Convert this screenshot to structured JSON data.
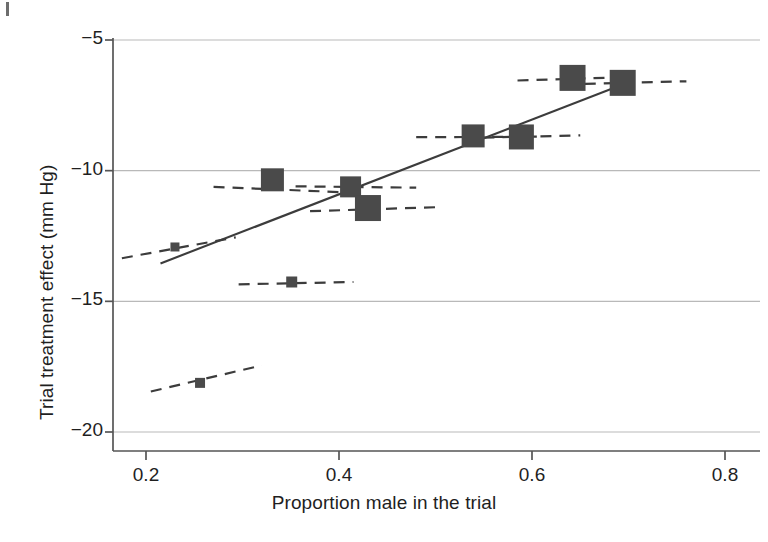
{
  "figure": {
    "background": "#ffffff",
    "marker_color": "#4a4a4a",
    "line_color": "#3c3c3c",
    "grid_color": "#b9b9b9",
    "axis_color": "#555555"
  },
  "chart_data": {
    "type": "scatter",
    "title": "",
    "xlabel": "Proportion male in the trial",
    "ylabel": "Trial treatment effect (mm Hg)",
    "xlim": [
      0.155,
      0.8
    ],
    "ylim": [
      -20.0,
      -4.4
    ],
    "xticks": [
      0.2,
      0.4,
      0.6,
      0.8
    ],
    "xticklabels": [
      "0.2",
      "0.4",
      "0.6",
      "0.8"
    ],
    "yticks": [
      -5,
      -10,
      -15,
      -20
    ],
    "yticklabels": [
      "−5",
      "−10",
      "−15",
      "−20"
    ],
    "grid": "horizontal",
    "legend": "none",
    "points": [
      {
        "x": 0.23,
        "y": -12.92,
        "size": 9,
        "label": "trial-1"
      },
      {
        "x": 0.256,
        "y": -18.12,
        "size": 10,
        "label": "trial-2"
      },
      {
        "x": 0.331,
        "y": -10.35,
        "size": 23,
        "label": "trial-3"
      },
      {
        "x": 0.351,
        "y": -14.26,
        "size": 11,
        "label": "trial-4"
      },
      {
        "x": 0.412,
        "y": -10.62,
        "size": 21,
        "label": "trial-5"
      },
      {
        "x": 0.43,
        "y": -11.43,
        "size": 26,
        "label": "trial-6"
      },
      {
        "x": 0.539,
        "y": -8.67,
        "size": 23,
        "label": "trial-7"
      },
      {
        "x": 0.589,
        "y": -8.71,
        "size": 25,
        "label": "trial-8"
      },
      {
        "x": 0.642,
        "y": -6.45,
        "size": 26,
        "label": "trial-9"
      },
      {
        "x": 0.694,
        "y": -6.64,
        "size": 26,
        "label": "trial-10"
      }
    ],
    "dashed_segments": [
      {
        "x0": 0.175,
        "y0": -13.35,
        "x1": 0.293,
        "y1": -12.55,
        "label": "ci-bar-1"
      },
      {
        "x0": 0.205,
        "y0": -18.45,
        "x1": 0.32,
        "y1": -17.45,
        "label": "ci-bar-2"
      },
      {
        "x0": 0.27,
        "y0": -10.62,
        "x1": 0.42,
        "y1": -10.85,
        "label": "ci-bar-3"
      },
      {
        "x0": 0.296,
        "y0": -14.35,
        "x1": 0.415,
        "y1": -14.26,
        "label": "ci-bar-4"
      },
      {
        "x0": 0.355,
        "y0": -10.6,
        "x1": 0.48,
        "y1": -10.65,
        "label": "ci-bar-5"
      },
      {
        "x0": 0.37,
        "y0": -11.55,
        "x1": 0.5,
        "y1": -11.4,
        "label": "ci-bar-6"
      },
      {
        "x0": 0.48,
        "y0": -8.72,
        "x1": 0.605,
        "y1": -8.7,
        "label": "ci-bar-7"
      },
      {
        "x0": 0.53,
        "y0": -8.75,
        "x1": 0.65,
        "y1": -8.65,
        "label": "ci-bar-8"
      },
      {
        "x0": 0.585,
        "y0": -6.55,
        "x1": 0.7,
        "y1": -6.42,
        "label": "ci-bar-9"
      },
      {
        "x0": 0.635,
        "y0": -6.7,
        "x1": 0.76,
        "y1": -6.58,
        "label": "ci-bar-10"
      }
    ],
    "regression_line": {
      "x0": 0.215,
      "y0": -13.55,
      "x1": 0.7,
      "y1": -6.62,
      "label": "meta-regression-line"
    }
  }
}
